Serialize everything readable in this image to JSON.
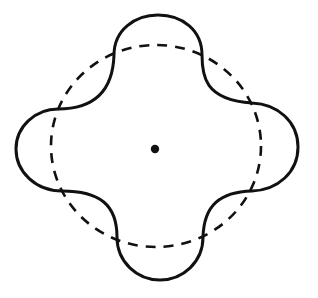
{
  "diagram": {
    "center": {
      "x": 155,
      "y": 149
    },
    "reference_circle": {
      "style": "dashed",
      "rx": 104,
      "ry": 101
    },
    "perturbed_curve": {
      "style": "solid",
      "lobes": 4,
      "lobe_directions": [
        "top",
        "right",
        "bottom",
        "left"
      ]
    },
    "center_point": {
      "radius": 4
    },
    "colors": {
      "stroke": "#111111",
      "background": "#ffffff"
    }
  }
}
